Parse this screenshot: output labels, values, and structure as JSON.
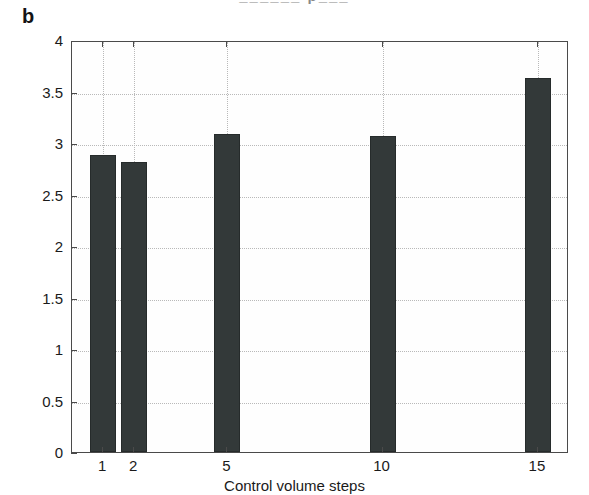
{
  "figure": {
    "panel_label": "b",
    "caption_remnant": "______ p___"
  },
  "colors": {
    "bar_fill": "#333939",
    "bar_edge": "#262b2b",
    "axis": "#4a4a4a",
    "grid": "#b9b9b9",
    "background": "#ffffff",
    "text": "#1a1a1a"
  },
  "chart_data": {
    "type": "bar",
    "title": "",
    "xlabel": "Control volume steps",
    "ylabel": "S [mg/ml]",
    "categories": [
      "1",
      "2",
      "5",
      "10",
      "15"
    ],
    "values": [
      2.88,
      2.82,
      3.09,
      3.07,
      3.63
    ],
    "x_positions": [
      1,
      2,
      5,
      10,
      15
    ],
    "xlim": [
      0,
      16
    ],
    "ylim": [
      0,
      4
    ],
    "yticks": [
      0,
      0.5,
      1,
      1.5,
      2,
      2.5,
      3,
      3.5,
      4
    ],
    "ytick_labels": [
      "0",
      "0.5",
      "1",
      "1.5",
      "2",
      "2.5",
      "3",
      "3.5",
      "4"
    ],
    "xticks": [
      1,
      2,
      5,
      10,
      15
    ],
    "xtick_labels": [
      "1",
      "2",
      "5",
      "10",
      "15"
    ],
    "grid": true,
    "grid_style": "dotted",
    "legend": null,
    "legend_position": "none",
    "series": [
      {
        "name": "S",
        "values": [
          2.88,
          2.82,
          3.09,
          3.07,
          3.63
        ]
      }
    ]
  }
}
